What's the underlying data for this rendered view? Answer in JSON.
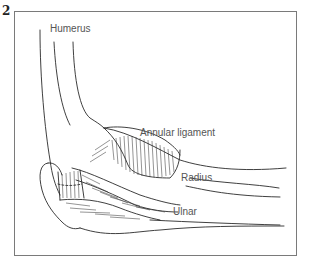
{
  "figure": {
    "number": "2",
    "type": "anatomical line drawing"
  },
  "labels": {
    "humerus": "Humerus",
    "annular_ligament": "Annular ligament",
    "radius": "Radius",
    "ulnar": "Ulnar"
  },
  "colors": {
    "line": "#2a2a2a",
    "label_text": "#555555",
    "frame": "#7a7a7a",
    "background": "#ffffff"
  }
}
